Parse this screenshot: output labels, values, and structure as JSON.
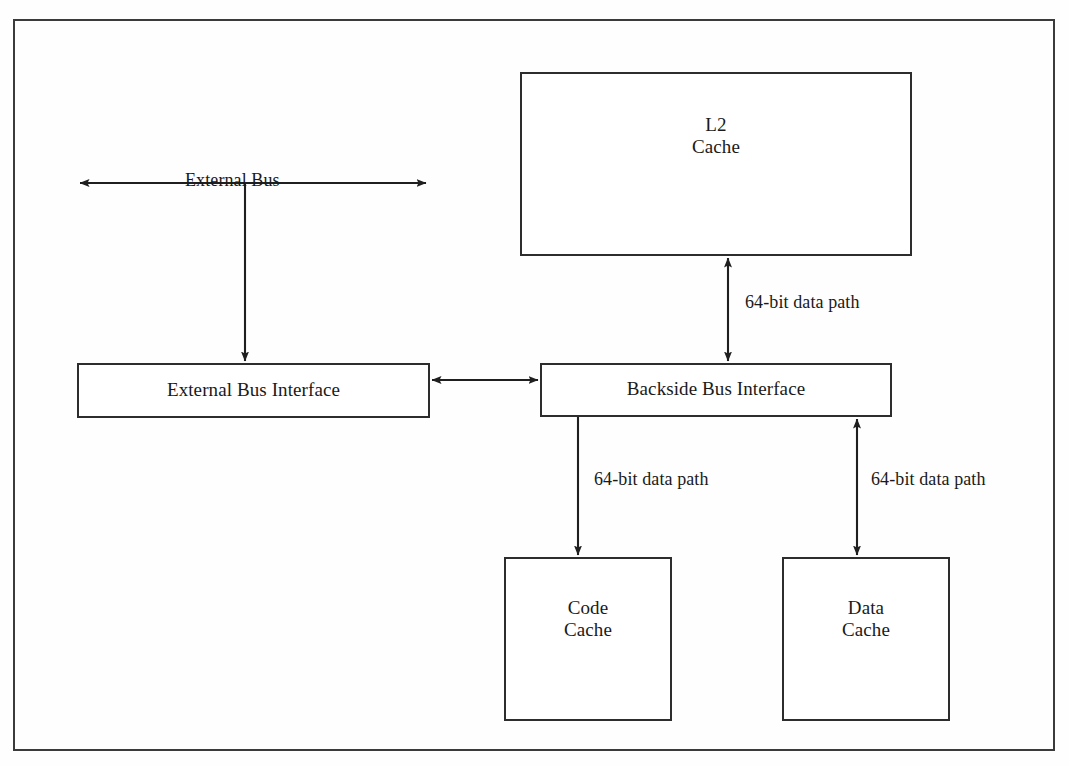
{
  "diagram": {
    "page_size": {
      "width": 1069,
      "height": 766
    },
    "frame": {
      "name": "outer-frame",
      "stroke": "#3b3b3b"
    },
    "ink_color": "#1f1f1f",
    "paper_color": "#ffffff"
  },
  "nodes": [
    {
      "id": "l2-cache",
      "label": "L2\nCache",
      "x": 520,
      "y": 72,
      "w": 392,
      "h": 184,
      "label_top": 112
    },
    {
      "id": "external-bus-interface",
      "label": "External Bus Interface",
      "x": 77,
      "y": 363,
      "w": 353,
      "h": 55,
      "label_top": 379
    },
    {
      "id": "backside-bus-interface",
      "label": "Backside Bus Interface",
      "x": 540,
      "y": 363,
      "w": 352,
      "h": 54,
      "label_top": 378
    },
    {
      "id": "code-cache",
      "label": "Code\nCache",
      "x": 504,
      "y": 557,
      "w": 168,
      "h": 164,
      "label_top": 596
    },
    {
      "id": "data-cache",
      "label": "Data\nCache",
      "x": 782,
      "y": 557,
      "w": 168,
      "h": 164,
      "label_top": 596
    }
  ],
  "edges": [
    {
      "id": "external-bus",
      "label": "External Bus",
      "kind": "bidirectional-horizontal",
      "x1": 78,
      "y1": 183,
      "x2": 428,
      "y2": 183,
      "label_x": 185,
      "label_y": 170
    },
    {
      "id": "external-bus-to-ebi",
      "label": "",
      "kind": "arrow-down",
      "x1": 245,
      "y1": 183,
      "x2": 245,
      "y2": 363
    },
    {
      "id": "ebi-to-bbi",
      "label": "",
      "kind": "bidirectional-horizontal",
      "x1": 430,
      "y1": 380,
      "x2": 540,
      "y2": 380
    },
    {
      "id": "bbi-to-l2",
      "label": "64-bit data path",
      "kind": "bidirectional-vertical",
      "x1": 728,
      "y1": 256,
      "x2": 728,
      "y2": 363,
      "label_x": 745,
      "label_y": 293
    },
    {
      "id": "bbi-to-code-cache",
      "label": "64-bit data path",
      "kind": "arrow-down",
      "x1": 578,
      "y1": 417,
      "x2": 578,
      "y2": 557,
      "label_x": 594,
      "label_y": 470
    },
    {
      "id": "bbi-to-data-cache",
      "label": "64-bit data path",
      "kind": "bidirectional-vertical",
      "x1": 857,
      "y1": 417,
      "x2": 857,
      "y2": 557,
      "label_x": 871,
      "label_y": 470
    }
  ],
  "artifacts": {
    "scan_top_clipped_text": ""
  }
}
